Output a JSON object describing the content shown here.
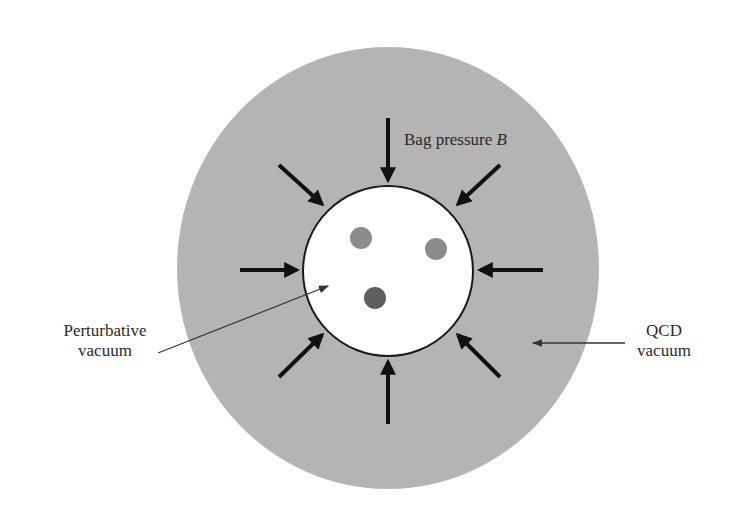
{
  "diagram": {
    "colors": {
      "qcd_vacuum": "#b4b4b4",
      "perturbative_vacuum": "#ffffff",
      "quark_1": "#8c8c8c",
      "quark_2": "#8c8c8c",
      "quark_3": "#5e5e5e",
      "arrow": "#111111",
      "pointer": "#333333"
    },
    "labels": {
      "bag_pressure": "Bag pressure ",
      "bag_pressure_symbol": "B",
      "perturbative_line1": "Perturbative",
      "perturbative_line2": "vacuum",
      "qcd_line1": "QCD",
      "qcd_line2": "vacuum"
    },
    "regions": [
      {
        "name": "QCD vacuum",
        "shape": "ellipse",
        "cx": 388,
        "cy": 268,
        "rx": 211,
        "ry": 221
      },
      {
        "name": "Perturbative vacuum (bag)",
        "shape": "circle",
        "cx": 388,
        "cy": 271,
        "r": 85
      }
    ],
    "quarks": [
      {
        "cx": 361,
        "cy": 238,
        "r": 11
      },
      {
        "cx": 436,
        "cy": 249,
        "r": 11
      },
      {
        "cx": 375,
        "cy": 298,
        "r": 11
      }
    ],
    "pressure_arrows_count": 8
  }
}
